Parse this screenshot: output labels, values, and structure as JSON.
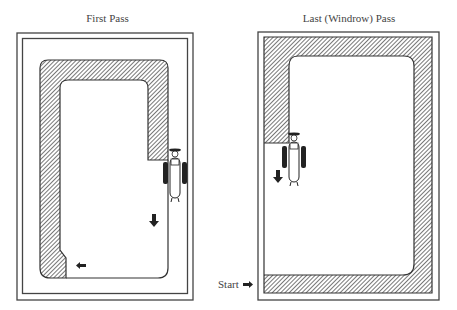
{
  "panels": [
    {
      "id": "first",
      "title": "First Pass"
    },
    {
      "id": "last",
      "title": "Last (Windrow) Pass"
    }
  ],
  "start_label": "Start",
  "colors": {
    "line": "#444444",
    "hatch": "#555555",
    "fill": "#ffffff"
  }
}
